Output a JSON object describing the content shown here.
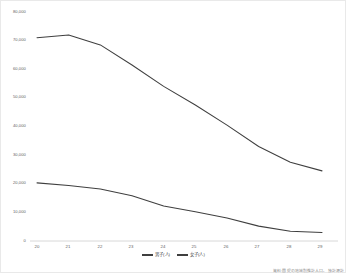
{
  "chart_data": {
    "type": "line",
    "title": "",
    "xlabel": "",
    "ylabel": "",
    "categories": [
      "20",
      "21",
      "22",
      "23",
      "24",
      "25",
      "26",
      "27",
      "28",
      "29"
    ],
    "ylim": [
      0,
      80000
    ],
    "ytick_labels": [
      "80,000",
      "70,000",
      "60,000",
      "50,000",
      "40,000",
      "30,000",
      "20,000",
      "10,000",
      "0"
    ],
    "ytick_values": [
      80000,
      70000,
      60000,
      50000,
      40000,
      30000,
      20000,
      10000,
      0
    ],
    "grid": false,
    "legend_position": "bottom",
    "series": [
      {
        "name": "男子(人)",
        "color": "#3f3f3f",
        "values": [
          71000,
          72000,
          68500,
          61500,
          54000,
          47500,
          40500,
          33000,
          27500,
          24500
        ]
      },
      {
        "name": "女子(人)",
        "color": "#3f3f3f",
        "values": [
          20300,
          19400,
          18200,
          15800,
          12200,
          10200,
          8000,
          5200,
          3400,
          3000
        ]
      }
    ],
    "source_note": "資料:国提の地域別推計人口、独計源計"
  },
  "axis": {
    "zero_label": "0"
  }
}
